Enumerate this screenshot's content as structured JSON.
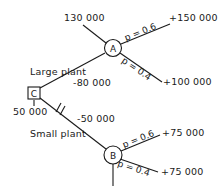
{
  "diagram": {
    "type": "decision-tree",
    "decision_node": {
      "id": "C",
      "value": "50 000"
    },
    "branches": [
      {
        "label": "Large plant",
        "cost": "-80 000",
        "chance_node": "A",
        "incoming_value": "130 000",
        "outcomes": [
          {
            "probability": "p = 0.6",
            "payoff": "+150 000"
          },
          {
            "probability": "p = 0.4",
            "payoff": "+100 000"
          }
        ]
      },
      {
        "label": "Small plant",
        "cost": "-50 000",
        "chance_node": "B",
        "pruned": true,
        "outcomes": [
          {
            "probability": "p = 0.6",
            "payoff": "+75 000"
          },
          {
            "probability": "p = 0.4",
            "payoff": "+75 000"
          }
        ]
      }
    ]
  },
  "colors": {
    "ink": "#1a1a1a",
    "background": "#ffffff"
  }
}
